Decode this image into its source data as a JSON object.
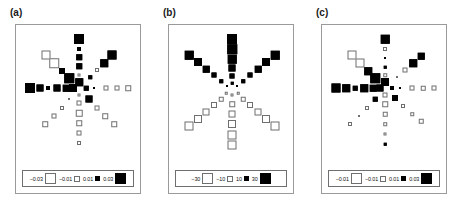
{
  "figure": {
    "type": "multi-panel-square-plot",
    "panel_count": 3
  },
  "panels": [
    {
      "label": "(a)",
      "legend": {
        "items": [
          {
            "text": "−0.03",
            "sign": "neg",
            "size": 11
          },
          {
            "text": "−0.01",
            "sign": "neg",
            "size": 6
          },
          {
            "text": "0.01",
            "sign": "pos",
            "size": 5
          },
          {
            "text": "0.03",
            "sign": "pos",
            "size": 11
          }
        ]
      }
    },
    {
      "label": "(b)",
      "legend": {
        "items": [
          {
            "text": "−30",
            "sign": "neg",
            "size": 11
          },
          {
            "text": "−10",
            "sign": "neg",
            "size": 6
          },
          {
            "text": "10",
            "sign": "pos",
            "size": 5
          },
          {
            "text": "30",
            "sign": "pos",
            "size": 11
          }
        ]
      }
    },
    {
      "label": "(c)",
      "legend": {
        "items": [
          {
            "text": "−0.01",
            "sign": "neg",
            "size": 11
          },
          {
            "text": "−0.01",
            "sign": "neg",
            "size": 6
          },
          {
            "text": "0.01",
            "sign": "pos",
            "size": 5
          },
          {
            "text": "0.03",
            "sign": "pos",
            "size": 11
          }
        ]
      }
    }
  ],
  "chart_data": [
    {
      "type": "scatter",
      "title": "(a)",
      "xlabel": "",
      "ylabel": "",
      "encoding": "square area = magnitude; filled black = positive, open outline = negative",
      "legend_values": [
        -0.03,
        -0.01,
        0.01,
        0.03
      ],
      "center": {
        "x": 63,
        "y": 63
      },
      "points": [
        {
          "x": 63,
          "y": 14,
          "value": 0.03,
          "sign": "pos",
          "size": 10
        },
        {
          "x": 63,
          "y": 24,
          "value": 0.008,
          "sign": "pos",
          "size": 4
        },
        {
          "x": 63,
          "y": 32,
          "value": 0.014,
          "sign": "pos",
          "size": 5.5
        },
        {
          "x": 63,
          "y": 41,
          "value": 0.014,
          "sign": "pos",
          "size": 5.5
        },
        {
          "x": 63,
          "y": 50,
          "value": 0.006,
          "sign": "neg",
          "size": 3
        },
        {
          "x": 63,
          "y": 57,
          "value": 0.022,
          "sign": "pos",
          "size": 7.5
        },
        {
          "x": 63,
          "y": 70,
          "value": -0.005,
          "sign": "neg",
          "size": 3
        },
        {
          "x": 63,
          "y": 78,
          "value": -0.012,
          "sign": "neg",
          "size": 5
        },
        {
          "x": 63,
          "y": 88,
          "value": -0.016,
          "sign": "neg",
          "size": 6.5
        },
        {
          "x": 63,
          "y": 98,
          "value": -0.014,
          "sign": "neg",
          "size": 5.5
        },
        {
          "x": 63,
          "y": 108,
          "value": -0.013,
          "sign": "neg",
          "size": 5
        },
        {
          "x": 63,
          "y": 118,
          "value": -0.01,
          "sign": "neg",
          "size": 4
        },
        {
          "x": 14,
          "y": 63,
          "value": 0.03,
          "sign": "pos",
          "size": 10
        },
        {
          "x": 24,
          "y": 63,
          "value": 0.02,
          "sign": "pos",
          "size": 7
        },
        {
          "x": 32,
          "y": 63,
          "value": 0.01,
          "sign": "pos",
          "size": 4
        },
        {
          "x": 41,
          "y": 63,
          "value": 0.02,
          "sign": "pos",
          "size": 7
        },
        {
          "x": 50,
          "y": 63,
          "value": 0.018,
          "sign": "pos",
          "size": 6.5
        },
        {
          "x": 57,
          "y": 63,
          "value": 0.024,
          "sign": "pos",
          "size": 8
        },
        {
          "x": 70,
          "y": 63,
          "value": 0.012,
          "sign": "pos",
          "size": 4.5
        },
        {
          "x": 78,
          "y": 63,
          "value": 0.004,
          "sign": "pos",
          "size": 2
        },
        {
          "x": 90,
          "y": 63,
          "value": -0.012,
          "sign": "neg",
          "size": 5
        },
        {
          "x": 101,
          "y": 63,
          "value": -0.012,
          "sign": "neg",
          "size": 5
        },
        {
          "x": 112,
          "y": 63,
          "value": -0.013,
          "sign": "neg",
          "size": 5.5
        },
        {
          "x": 30,
          "y": 30,
          "value": -0.026,
          "sign": "neg",
          "size": 9
        },
        {
          "x": 38,
          "y": 38,
          "value": -0.028,
          "sign": "neg",
          "size": 9.5
        },
        {
          "x": 46,
          "y": 46,
          "value": 0.016,
          "sign": "pos",
          "size": 6
        },
        {
          "x": 53,
          "y": 53,
          "value": 0.028,
          "sign": "pos",
          "size": 9.5
        },
        {
          "x": 96,
          "y": 30,
          "value": 0.026,
          "sign": "pos",
          "size": 9
        },
        {
          "x": 88,
          "y": 38,
          "value": 0.022,
          "sign": "pos",
          "size": 7.5
        },
        {
          "x": 81,
          "y": 45,
          "value": -0.01,
          "sign": "neg",
          "size": 4
        },
        {
          "x": 74,
          "y": 52,
          "value": 0.008,
          "sign": "pos",
          "size": 3.5
        },
        {
          "x": 29,
          "y": 99,
          "value": -0.013,
          "sign": "neg",
          "size": 5.5
        },
        {
          "x": 38,
          "y": 91,
          "value": -0.012,
          "sign": "neg",
          "size": 5
        },
        {
          "x": 46,
          "y": 83,
          "value": -0.01,
          "sign": "neg",
          "size": 4
        },
        {
          "x": 53,
          "y": 74,
          "value": -0.004,
          "sign": "neg",
          "size": 2
        },
        {
          "x": 98,
          "y": 99,
          "value": -0.013,
          "sign": "neg",
          "size": 5.5
        },
        {
          "x": 89,
          "y": 91,
          "value": -0.013,
          "sign": "neg",
          "size": 5.5
        },
        {
          "x": 81,
          "y": 83,
          "value": -0.012,
          "sign": "neg",
          "size": 5
        },
        {
          "x": 73,
          "y": 74,
          "value": 0.02,
          "sign": "pos",
          "size": 7
        }
      ]
    },
    {
      "type": "scatter",
      "title": "(b)",
      "xlabel": "",
      "ylabel": "",
      "encoding": "square area = magnitude; filled black = positive, open outline = negative",
      "legend_values": [
        -30,
        -10,
        10,
        30
      ],
      "center": {
        "x": 63,
        "y": 63
      },
      "points": [
        {
          "x": 63,
          "y": 14,
          "value": 32,
          "sign": "pos",
          "size": 10
        },
        {
          "x": 63,
          "y": 24,
          "value": 30,
          "sign": "pos",
          "size": 9.5
        },
        {
          "x": 63,
          "y": 34,
          "value": 26,
          "sign": "pos",
          "size": 8.5
        },
        {
          "x": 63,
          "y": 43,
          "value": 22,
          "sign": "pos",
          "size": 7
        },
        {
          "x": 63,
          "y": 51,
          "value": 14,
          "sign": "pos",
          "size": 5
        },
        {
          "x": 63,
          "y": 58,
          "value": 6,
          "sign": "pos",
          "size": 2.5
        },
        {
          "x": 20,
          "y": 30,
          "value": 26,
          "sign": "pos",
          "size": 8.5
        },
        {
          "x": 29,
          "y": 37,
          "value": 24,
          "sign": "pos",
          "size": 8
        },
        {
          "x": 37,
          "y": 44,
          "value": 20,
          "sign": "pos",
          "size": 6.5
        },
        {
          "x": 45,
          "y": 50,
          "value": 14,
          "sign": "pos",
          "size": 5
        },
        {
          "x": 52,
          "y": 56,
          "value": 9,
          "sign": "pos",
          "size": 3.5
        },
        {
          "x": 58,
          "y": 61,
          "value": 5,
          "sign": "pos",
          "size": 2
        },
        {
          "x": 106,
          "y": 30,
          "value": 26,
          "sign": "pos",
          "size": 8.5
        },
        {
          "x": 97,
          "y": 37,
          "value": 24,
          "sign": "pos",
          "size": 8
        },
        {
          "x": 89,
          "y": 44,
          "value": 20,
          "sign": "pos",
          "size": 6.5
        },
        {
          "x": 81,
          "y": 50,
          "value": 14,
          "sign": "pos",
          "size": 5
        },
        {
          "x": 74,
          "y": 56,
          "value": 9,
          "sign": "pos",
          "size": 3.5
        },
        {
          "x": 68,
          "y": 61,
          "value": 5,
          "sign": "pos",
          "size": 2
        },
        {
          "x": 63,
          "y": 70,
          "value": -8,
          "sign": "neg",
          "size": 3
        },
        {
          "x": 63,
          "y": 79,
          "value": -16,
          "sign": "neg",
          "size": 5.5
        },
        {
          "x": 63,
          "y": 89,
          "value": -22,
          "sign": "neg",
          "size": 7
        },
        {
          "x": 63,
          "y": 99,
          "value": -26,
          "sign": "neg",
          "size": 8
        },
        {
          "x": 63,
          "y": 110,
          "value": -28,
          "sign": "neg",
          "size": 9
        },
        {
          "x": 63,
          "y": 120,
          "value": -28,
          "sign": "neg",
          "size": 9
        },
        {
          "x": 57,
          "y": 68,
          "value": -6,
          "sign": "neg",
          "size": 2.5
        },
        {
          "x": 52,
          "y": 74,
          "value": -12,
          "sign": "neg",
          "size": 4.5
        },
        {
          "x": 45,
          "y": 80,
          "value": -18,
          "sign": "neg",
          "size": 6
        },
        {
          "x": 37,
          "y": 87,
          "value": -22,
          "sign": "neg",
          "size": 7
        },
        {
          "x": 29,
          "y": 94,
          "value": -26,
          "sign": "neg",
          "size": 8
        },
        {
          "x": 20,
          "y": 101,
          "value": -28,
          "sign": "neg",
          "size": 9
        },
        {
          "x": 69,
          "y": 68,
          "value": -6,
          "sign": "neg",
          "size": 2.5
        },
        {
          "x": 74,
          "y": 74,
          "value": -12,
          "sign": "neg",
          "size": 4.5
        },
        {
          "x": 81,
          "y": 80,
          "value": -18,
          "sign": "neg",
          "size": 6
        },
        {
          "x": 89,
          "y": 87,
          "value": -22,
          "sign": "neg",
          "size": 7
        },
        {
          "x": 97,
          "y": 94,
          "value": -26,
          "sign": "neg",
          "size": 8
        },
        {
          "x": 106,
          "y": 101,
          "value": -28,
          "sign": "neg",
          "size": 9
        }
      ]
    },
    {
      "type": "scatter",
      "title": "(c)",
      "xlabel": "",
      "ylabel": "",
      "encoding": "square area = magnitude; filled black = positive, open outline = negative",
      "legend_values": [
        -0.01,
        -0.01,
        0.01,
        0.03
      ],
      "center": {
        "x": 63,
        "y": 63
      },
      "points": [
        {
          "x": 63,
          "y": 14,
          "value": 0.026,
          "sign": "pos",
          "size": 8.5
        },
        {
          "x": 63,
          "y": 24,
          "value": -0.008,
          "sign": "neg",
          "size": 4
        },
        {
          "x": 63,
          "y": 33,
          "value": 0.004,
          "sign": "pos",
          "size": 2
        },
        {
          "x": 63,
          "y": 42,
          "value": 0.006,
          "sign": "pos",
          "size": 2.5
        },
        {
          "x": 63,
          "y": 50,
          "value": -0.008,
          "sign": "neg",
          "size": 3.5
        },
        {
          "x": 63,
          "y": 57,
          "value": 0.024,
          "sign": "pos",
          "size": 8
        },
        {
          "x": 63,
          "y": 70,
          "value": -0.012,
          "sign": "neg",
          "size": 5
        },
        {
          "x": 63,
          "y": 79,
          "value": -0.013,
          "sign": "neg",
          "size": 5.5
        },
        {
          "x": 63,
          "y": 89,
          "value": -0.011,
          "sign": "neg",
          "size": 4.5
        },
        {
          "x": 63,
          "y": 99,
          "value": -0.008,
          "sign": "neg",
          "size": 3.5
        },
        {
          "x": 63,
          "y": 109,
          "value": -0.007,
          "sign": "neg",
          "size": 3
        },
        {
          "x": 63,
          "y": 119,
          "value": 0.006,
          "sign": "pos",
          "size": 2.5
        },
        {
          "x": 14,
          "y": 63,
          "value": 0.028,
          "sign": "pos",
          "size": 9
        },
        {
          "x": 24,
          "y": 63,
          "value": 0.024,
          "sign": "pos",
          "size": 7.5
        },
        {
          "x": 33,
          "y": 63,
          "value": 0.012,
          "sign": "pos",
          "size": 4.5
        },
        {
          "x": 42,
          "y": 63,
          "value": 0.024,
          "sign": "pos",
          "size": 7.5
        },
        {
          "x": 51,
          "y": 63,
          "value": 0.02,
          "sign": "pos",
          "size": 6.5
        },
        {
          "x": 58,
          "y": 63,
          "value": 0.022,
          "sign": "pos",
          "size": 7
        },
        {
          "x": 70,
          "y": 63,
          "value": 0.01,
          "sign": "pos",
          "size": 4
        },
        {
          "x": 78,
          "y": 63,
          "value": 0.004,
          "sign": "pos",
          "size": 2
        },
        {
          "x": 90,
          "y": 63,
          "value": -0.012,
          "sign": "neg",
          "size": 5
        },
        {
          "x": 101,
          "y": 63,
          "value": -0.011,
          "sign": "neg",
          "size": 4.5
        },
        {
          "x": 112,
          "y": 63,
          "value": -0.012,
          "sign": "neg",
          "size": 5
        },
        {
          "x": 30,
          "y": 30,
          "value": -0.026,
          "sign": "neg",
          "size": 9
        },
        {
          "x": 38,
          "y": 38,
          "value": -0.026,
          "sign": "neg",
          "size": 9
        },
        {
          "x": 46,
          "y": 46,
          "value": 0.022,
          "sign": "pos",
          "size": 7.5
        },
        {
          "x": 53,
          "y": 53,
          "value": 0.028,
          "sign": "pos",
          "size": 9.5
        },
        {
          "x": 99,
          "y": 31,
          "value": 0.02,
          "sign": "pos",
          "size": 6.5
        },
        {
          "x": 91,
          "y": 38,
          "value": 0.022,
          "sign": "pos",
          "size": 7.5
        },
        {
          "x": 83,
          "y": 45,
          "value": -0.012,
          "sign": "neg",
          "size": 5
        },
        {
          "x": 75,
          "y": 52,
          "value": -0.004,
          "sign": "neg",
          "size": 2
        },
        {
          "x": 28,
          "y": 99,
          "value": -0.01,
          "sign": "neg",
          "size": 4
        },
        {
          "x": 37,
          "y": 91,
          "value": -0.004,
          "sign": "neg",
          "size": 2
        },
        {
          "x": 45,
          "y": 83,
          "value": -0.009,
          "sign": "neg",
          "size": 4
        },
        {
          "x": 53,
          "y": 74,
          "value": 0.012,
          "sign": "pos",
          "size": 4.5
        },
        {
          "x": 99,
          "y": 96,
          "value": -0.011,
          "sign": "neg",
          "size": 4.5
        },
        {
          "x": 90,
          "y": 89,
          "value": -0.008,
          "sign": "neg",
          "size": 3.5
        },
        {
          "x": 81,
          "y": 81,
          "value": -0.009,
          "sign": "neg",
          "size": 4
        },
        {
          "x": 73,
          "y": 73,
          "value": 0.018,
          "sign": "pos",
          "size": 6
        }
      ]
    }
  ]
}
